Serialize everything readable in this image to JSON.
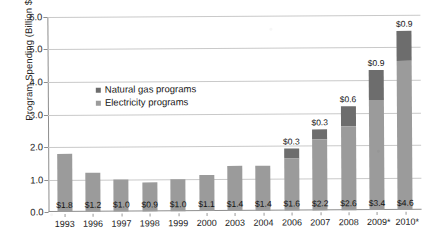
{
  "chart_data": {
    "type": "bar",
    "subtype": "stacked-vertical",
    "title": "",
    "xlabel": "",
    "ylabel": "Program Spending (Billion $)",
    "ylim": [
      0,
      6.0
    ],
    "yticks": [
      "0.0",
      "1.0",
      "2.0",
      "3.0",
      "4.0",
      "5.0",
      "6.0"
    ],
    "ytick_values": [
      0,
      1,
      2,
      3,
      4,
      5,
      6
    ],
    "grid": true,
    "grid_axis": "y",
    "legend_position": "inside-upper-left",
    "categories": [
      "1993",
      "1996",
      "1997",
      "1998",
      "1999",
      "2000",
      "2003",
      "2004",
      "2006",
      "2007",
      "2008",
      "2009*",
      "2010*"
    ],
    "series": [
      {
        "name": "Electricity programs",
        "color": "#9b9b9b",
        "values": [
          1.8,
          1.2,
          1.0,
          0.9,
          1.0,
          1.1,
          1.4,
          1.4,
          1.6,
          2.2,
          2.6,
          3.4,
          4.6
        ],
        "labels": [
          "$1.8",
          "$1.2",
          "$1.0",
          "$0.9",
          "$1.0",
          "$1.1",
          "$1.4",
          "$1.4",
          "$1.6",
          "$2.2",
          "$2.6",
          "$3.4",
          "$4.6"
        ]
      },
      {
        "name": "Natural gas programs",
        "color": "#6d6d6d",
        "values": [
          0,
          0,
          0,
          0,
          0,
          0,
          0,
          0,
          0.3,
          0.3,
          0.6,
          0.9,
          0.9
        ],
        "labels": [
          "",
          "",
          "",
          "",
          "",
          "",
          "",
          "",
          "$0.3",
          "$0.3",
          "$0.6",
          "$0.9",
          "$0.9"
        ]
      }
    ],
    "totals": [
      1.8,
      1.2,
      1.0,
      0.9,
      1.0,
      1.1,
      1.4,
      1.4,
      1.9,
      2.5,
      3.2,
      4.3,
      5.5
    ]
  },
  "legend": {
    "items": [
      {
        "label": "Natural gas programs",
        "color": "#6d6d6d"
      },
      {
        "label": "Electricity programs",
        "color": "#9b9b9b"
      }
    ]
  },
  "axis": {
    "y_title": "Program Spending (Billion $)"
  }
}
